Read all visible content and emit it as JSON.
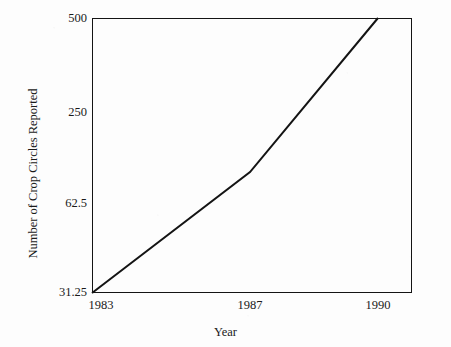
{
  "chart_data": {
    "type": "line",
    "title": "",
    "subtitle": "",
    "xlabel": "Year",
    "ylabel": "Number of Crop Circles Reported",
    "grid": false,
    "legend": "none",
    "y_scale": "log2 (equally spaced labeled ticks)",
    "x_tick_labels": [
      "1983",
      "1987",
      "1990"
    ],
    "x_tick_values": [
      1983,
      1987,
      1990
    ],
    "y_tick_labels": [
      "500",
      "250",
      "62.5",
      "31.25"
    ],
    "y_tick_values": [
      500,
      250,
      62.5,
      31.25
    ],
    "ylim": [
      31.25,
      500
    ],
    "xlim": [
      1983,
      1991
    ],
    "series": [
      {
        "name": "Crop circles reported",
        "x": [
          1983,
          1987,
          1990
        ],
        "y": [
          31.25,
          100,
          500
        ],
        "labels": [
          "1983",
          "1987",
          "1990"
        ],
        "color": "#141414"
      }
    ]
  },
  "axis": {
    "y_ticks": [
      {
        "label": "500",
        "top": 12
      },
      {
        "label": "250",
        "top": 106
      },
      {
        "label": "62.5",
        "top": 197
      },
      {
        "label": "31.25",
        "top": 286
      }
    ],
    "x_ticks": [
      {
        "label": "1983",
        "left": 92
      },
      {
        "label": "1987",
        "left": 250
      },
      {
        "label": "1990",
        "left": 378
      }
    ]
  },
  "line": {
    "points": "0,275 158,159 286,0",
    "stroke": "#141414",
    "stroke_width": 2
  },
  "frame": {
    "border_color": "#141414"
  }
}
